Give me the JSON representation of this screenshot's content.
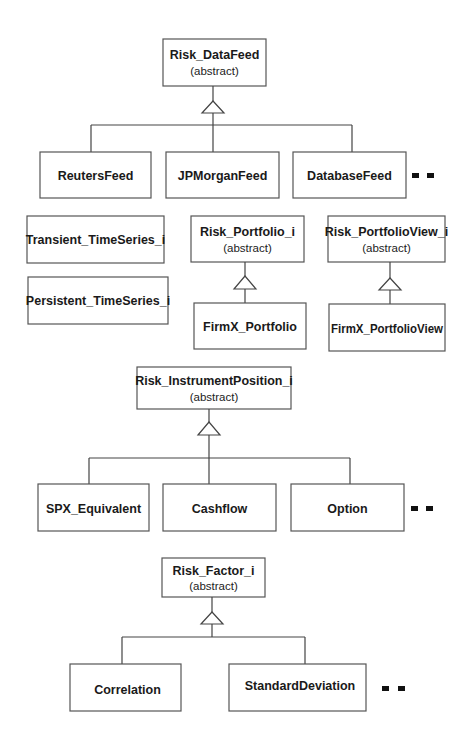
{
  "diagram": {
    "type": "class-hierarchy",
    "groups": [
      {
        "id": "datafeed",
        "parent": {
          "name": "Risk_DataFeed",
          "stereotype": "(abstract)"
        },
        "children": [
          {
            "name": "ReutersFeed"
          },
          {
            "name": "JPMorganFeed"
          },
          {
            "name": "DatabaseFeed"
          }
        ],
        "continuation": true
      },
      {
        "id": "timeseries",
        "standalone": [
          {
            "name": "Transient_TimeSeries_i"
          },
          {
            "name": "Persistent_TimeSeries_i"
          }
        ]
      },
      {
        "id": "portfolio",
        "parent": {
          "name": "Risk_Portfolio_i",
          "stereotype": "(abstract)"
        },
        "children": [
          {
            "name": "FirmX_Portfolio"
          }
        ]
      },
      {
        "id": "portfolioview",
        "parent": {
          "name": "Risk_PortfolioView_i",
          "stereotype": "(abstract)"
        },
        "children": [
          {
            "name": "FirmX_PortfolioView"
          }
        ]
      },
      {
        "id": "instrumentposition",
        "parent": {
          "name": "Risk_InstrumentPosition_i",
          "stereotype": "(abstract)"
        },
        "children": [
          {
            "name": "SPX_Equivalent"
          },
          {
            "name": "Cashflow"
          },
          {
            "name": "Option"
          }
        ],
        "continuation": true
      },
      {
        "id": "factor",
        "parent": {
          "name": "Risk_Factor_i",
          "stereotype": "(abstract)"
        },
        "children": [
          {
            "name": "Correlation"
          },
          {
            "name": "StandardDeviation"
          }
        ],
        "continuation": true
      }
    ],
    "colors": {
      "background": "#ffffff",
      "box_stroke": "#555555",
      "line": "#444444",
      "text": "#1a1a1a"
    }
  }
}
